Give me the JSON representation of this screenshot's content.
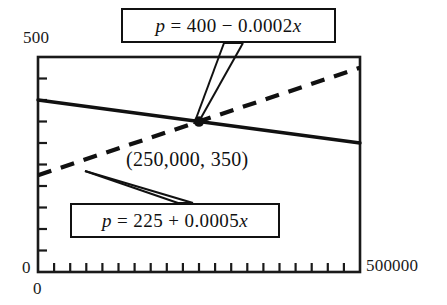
{
  "figure": {
    "title": "",
    "axes": {
      "y_max_label": "500",
      "y_min_label": "0",
      "x_min_label": "0",
      "x_max_label": "500000"
    },
    "annotations": {
      "demand_equation": "p = 400 − 0.0002x",
      "demand_equation_parts": {
        "lhs": "p",
        "eq": "=",
        "intercept": "400",
        "op": "−",
        "slope": "0.0002",
        "var": "x"
      },
      "supply_equation": "p = 225 + 0.0005x",
      "supply_equation_parts": {
        "lhs": "p",
        "eq": "=",
        "intercept": "225",
        "op": "+",
        "slope": "0.0005",
        "var": "x"
      },
      "equilibrium_point_label": "(250,000, 350)"
    }
  },
  "chart_data": {
    "type": "line",
    "title": "",
    "xlabel": "",
    "ylabel": "",
    "xlim": [
      0,
      500000
    ],
    "ylim": [
      0,
      500
    ],
    "grid": false,
    "legend_position": "none",
    "x_ticks": [
      0,
      500000
    ],
    "x_tick_labels": [
      "0",
      "500000"
    ],
    "y_ticks": [
      0,
      500
    ],
    "y_tick_labels": [
      "0",
      "500"
    ],
    "x_minor_tick_count": 20,
    "y_minor_tick_count": 10,
    "series": [
      {
        "name": "p = 400 - 0.0002x",
        "style": "solid",
        "color": "#111111",
        "intercept": 400,
        "slope": -0.0002,
        "x": [
          0,
          250000,
          500000
        ],
        "values": [
          400,
          350,
          300
        ]
      },
      {
        "name": "p = 225 + 0.0005x",
        "style": "dashed",
        "color": "#111111",
        "intercept": 225,
        "slope": 0.0005,
        "x": [
          0,
          250000,
          500000
        ],
        "values": [
          225,
          350,
          475
        ]
      }
    ],
    "points": [
      {
        "label": "(250,000, 350)",
        "x": 250000,
        "y": 350,
        "marker": "filled-circle"
      }
    ]
  }
}
